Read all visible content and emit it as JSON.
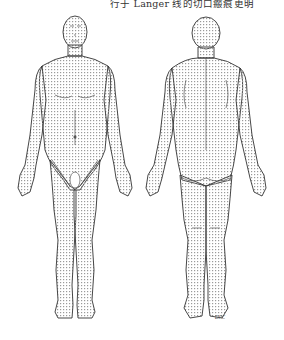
{
  "caption": "行于 Langer 线的切口瘢痕更明",
  "figures": [
    {
      "view": "anterior",
      "label": "front-body-langer-lines"
    },
    {
      "view": "posterior",
      "label": "back-body-langer-lines"
    }
  ],
  "signature": "DPC",
  "colors": {
    "outline": "#333333",
    "lines": "#9a9a9a",
    "background": "#ffffff"
  }
}
